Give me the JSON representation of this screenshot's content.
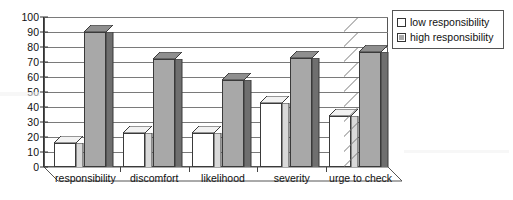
{
  "chart_data": {
    "type": "bar",
    "title": "",
    "subtitle": "",
    "xlabel": "",
    "ylabel": "",
    "categories": [
      "responsibility",
      "discomfort",
      "likelihood",
      "severity",
      "urge to check"
    ],
    "series": [
      {
        "name": "low responsibility",
        "color": "#ffffff",
        "values": [
          16,
          23,
          23,
          43,
          34
        ]
      },
      {
        "name": "high responsibility",
        "color": "#a8a8a8",
        "values": [
          90,
          72,
          58,
          73,
          77
        ]
      }
    ],
    "ylim": [
      0,
      100
    ],
    "ytick_step": 10,
    "yticks": [
      "100",
      "90",
      "80",
      "70",
      "60",
      "50",
      "40",
      "30",
      "20",
      "10",
      "0"
    ],
    "grid": true,
    "grid_axis": "y",
    "legend_position": "top-right",
    "style": "3d-clustered-column",
    "annotations": []
  },
  "legend": {
    "entries": [
      {
        "label": "low responsibility",
        "swatch": "white-square"
      },
      {
        "label": "high responsibility",
        "swatch": "gray-square"
      }
    ]
  },
  "colors": {
    "low_series": "#ffffff",
    "high_series": "#a8a8a8",
    "bar_outline": "#3a3a3a",
    "gridline": "#7a7a7a",
    "axis": "#333333",
    "text": "#111111",
    "plot_background": "#ffffff"
  }
}
